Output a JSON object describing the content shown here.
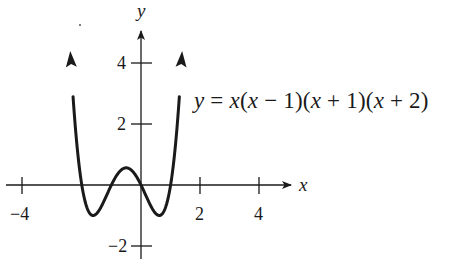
{
  "chart_data": {
    "type": "line",
    "title": "",
    "equation": "y = x(x − 1)(x + 1)(x + 2)",
    "function": "x*(x-1)*(x+1)*(x+2)",
    "xlabel": "x",
    "ylabel": "y",
    "x_ticks": [
      -4,
      2,
      4
    ],
    "y_ticks": [
      4,
      2,
      -2
    ],
    "x_tick_labels": [
      "−4",
      "2",
      "4"
    ],
    "y_tick_labels": [
      "4",
      "2",
      "−2"
    ],
    "xlim": [
      -4.2,
      5.0
    ],
    "ylim": [
      -2.4,
      5.0
    ],
    "grid": false,
    "legend": null,
    "roots": [
      -2,
      -1,
      0,
      1
    ],
    "local_max": {
      "x": -0.5,
      "y": 0.5625
    },
    "local_mins": [
      {
        "x": -1.618,
        "y": -1
      },
      {
        "x": 0.618,
        "y": -1
      }
    ],
    "curve_x_range": [
      -2.39,
      1.39
    ],
    "end_arrows": true,
    "series": [
      {
        "name": "y = x(x-1)(x+1)(x+2)",
        "x": [
          -2.39,
          -2.3,
          -2.2,
          -2.1,
          -2.0,
          -1.9,
          -1.8,
          -1.618,
          -1.4,
          -1.2,
          -1.0,
          -0.8,
          -0.5,
          -0.2,
          0.0,
          0.2,
          0.4,
          0.618,
          0.8,
          0.9,
          1.0,
          1.1,
          1.2,
          1.3,
          1.39
        ],
        "y": [
          4.51,
          3.31,
          2.27,
          1.39,
          0.0,
          -0.62,
          -0.89,
          -1.0,
          -0.81,
          -0.35,
          0.0,
          0.35,
          0.56,
          0.35,
          0.0,
          -0.42,
          -0.81,
          -1.0,
          -0.81,
          -0.49,
          0.0,
          0.71,
          1.69,
          2.96,
          4.43
        ]
      }
    ]
  },
  "labels": {
    "x_axis": "x",
    "y_axis": "y",
    "equation_parts": {
      "y": "y",
      "eq": " = ",
      "x1": "x",
      "p1": "(",
      "x2": "x",
      "m1": " − 1)(",
      "x3": "x",
      "m2": " + 1)(",
      "x4": "x",
      "m3": " + 2)"
    }
  },
  "colors": {
    "ink": "#1a1a1a",
    "background": "#ffffff"
  }
}
